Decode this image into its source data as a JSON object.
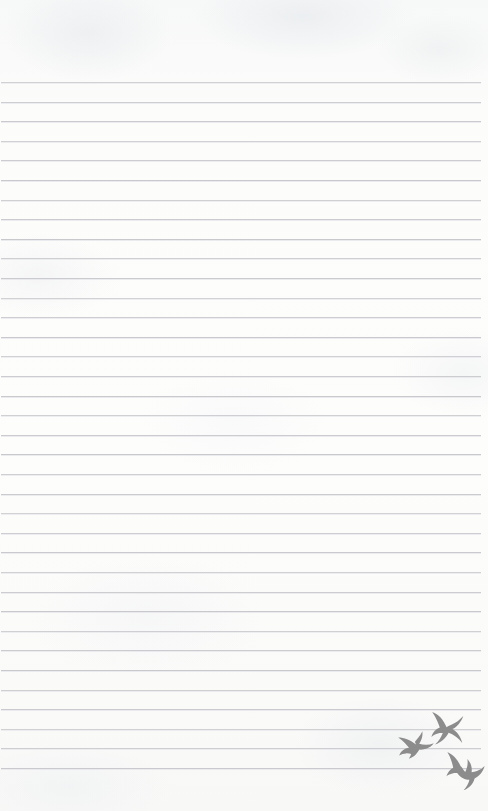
{
  "page": {
    "kind": "lined-notebook-page",
    "width": 488,
    "height": 811,
    "paper_color": "#fbfbfa",
    "rule_color": "#c9c9cd",
    "rule_spacing_px": 19.6,
    "rule_first_y": 82,
    "rule_last_y": 771,
    "rule_left_x": 1,
    "rule_right_x": 481,
    "rule_count": 36,
    "text_content": "",
    "header_text": "",
    "footer_text": ""
  },
  "decoration": {
    "name": "flying-birds-flock",
    "color": "#8c8c8c",
    "count": 3,
    "birds": [
      {
        "name": "bird-upper-right",
        "label": "bird-flying-upward"
      },
      {
        "name": "bird-lower-left",
        "label": "bird-flying-left"
      },
      {
        "name": "bird-lower-right",
        "label": "bird-perched-wings-up"
      }
    ]
  }
}
